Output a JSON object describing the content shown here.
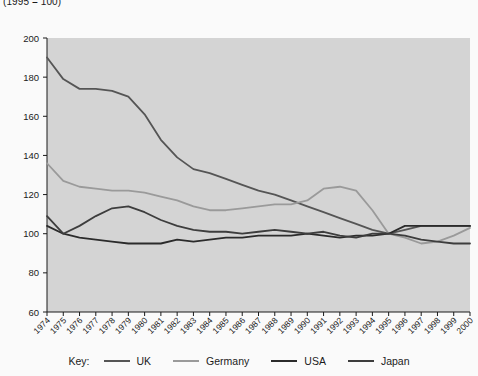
{
  "note": "(1995 = 100)",
  "legend": {
    "title": "Key:",
    "items": [
      {
        "label": "UK",
        "color": "#555555"
      },
      {
        "label": "Germany",
        "color": "#9a9a9a"
      },
      {
        "label": "USA",
        "color": "#2b2b2b"
      },
      {
        "label": "Japan",
        "color": "#3d3d3d"
      }
    ]
  },
  "chart_data": {
    "type": "line",
    "title": "",
    "subtitle": "(1995 = 100)",
    "xlabel": "",
    "ylabel": "",
    "ylim": [
      60,
      200
    ],
    "ytick_step": 20,
    "yticks": [
      60,
      80,
      100,
      120,
      140,
      160,
      180,
      200
    ],
    "grid": false,
    "legend_position": "bottom",
    "plot_background": "#d4d4d4",
    "x": [
      1974,
      1975,
      1976,
      1977,
      1978,
      1979,
      1980,
      1981,
      1982,
      1983,
      1984,
      1985,
      1986,
      1987,
      1988,
      1989,
      1990,
      1991,
      1992,
      1993,
      1994,
      1995,
      1996,
      1997,
      1998,
      1999,
      2000
    ],
    "categories": [
      "1974",
      "1975",
      "1976",
      "1977",
      "1978",
      "1979",
      "1980",
      "1981",
      "1982",
      "1983",
      "1984",
      "1985",
      "1986",
      "1987",
      "1988",
      "1989",
      "1990",
      "1991",
      "1992",
      "1993",
      "1994",
      "1995",
      "1996",
      "1997",
      "1998",
      "1999",
      "2000"
    ],
    "series": [
      {
        "name": "UK",
        "color": "#555555",
        "values": [
          190,
          179,
          174,
          174,
          173,
          170,
          161,
          148,
          139,
          133,
          131,
          128,
          125,
          122,
          120,
          117,
          114,
          111,
          108,
          105,
          102,
          100,
          102,
          104,
          104,
          104,
          104
        ]
      },
      {
        "name": "Germany",
        "color": "#9a9a9a",
        "values": [
          136,
          127,
          124,
          123,
          122,
          122,
          121,
          119,
          117,
          114,
          112,
          112,
          113,
          114,
          115,
          115,
          117,
          123,
          124,
          122,
          112,
          100,
          98,
          95,
          96,
          99,
          103
        ]
      },
      {
        "name": "USA",
        "color": "#2b2b2b",
        "values": [
          104,
          100,
          98,
          97,
          96,
          95,
          95,
          95,
          97,
          96,
          97,
          98,
          98,
          99,
          99,
          99,
          100,
          99,
          98,
          99,
          99,
          100,
          104,
          104,
          104,
          104,
          104
        ]
      },
      {
        "name": "Japan",
        "color": "#3d3d3d",
        "values": [
          109,
          100,
          104,
          109,
          113,
          114,
          111,
          107,
          104,
          102,
          101,
          101,
          100,
          101,
          102,
          101,
          100,
          101,
          99,
          98,
          100,
          100,
          99,
          97,
          96,
          95,
          95
        ]
      }
    ]
  }
}
